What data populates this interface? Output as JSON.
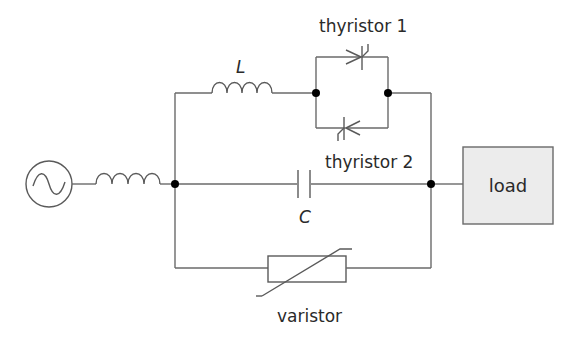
{
  "diagram": {
    "type": "circuit-schematic",
    "components": {
      "source": {
        "kind": "ac-voltage-source",
        "symbol": "sine-wave"
      },
      "source_inductor": {
        "kind": "inductor"
      },
      "inductor_L": {
        "kind": "inductor",
        "label": "L"
      },
      "thyristor_1": {
        "kind": "thyristor",
        "label": "thyristor 1"
      },
      "thyristor_2": {
        "kind": "thyristor",
        "label": "thyristor 2"
      },
      "capacitor_C": {
        "kind": "capacitor",
        "label": "C"
      },
      "varistor": {
        "kind": "varistor",
        "label": "varistor"
      },
      "load": {
        "kind": "load-block",
        "label": "load"
      }
    },
    "colors": {
      "wire": "#6a6a6a",
      "node": "#000000",
      "load_fill": "#ececec",
      "text": "#2a2a2a"
    }
  }
}
